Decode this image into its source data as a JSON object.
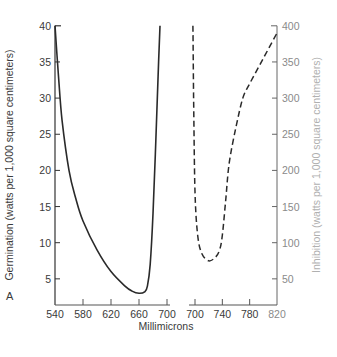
{
  "chart_data": {
    "type": "line",
    "title": "",
    "panel_label": "A",
    "xlabel": "Millimicrons",
    "ylabel_left": "Germination (watts per 1,000 square centimeters)",
    "ylabel_right": "Inhibition (watts per 1,000 square centimeters)",
    "x_axis_broken": true,
    "x_segments": [
      {
        "range": [
          540,
          700
        ],
        "ticks": [
          540,
          580,
          620,
          660,
          700
        ]
      },
      {
        "range": [
          700,
          820
        ],
        "ticks": [
          700,
          740,
          780,
          820
        ]
      }
    ],
    "ylim_left": [
      0,
      40
    ],
    "yticks_left": [
      5,
      10,
      15,
      20,
      25,
      30,
      35,
      40
    ],
    "ylim_right": [
      0,
      400
    ],
    "yticks_right": [
      50,
      100,
      150,
      200,
      250,
      300,
      350,
      400
    ],
    "grid": false,
    "legend": "none",
    "series": [
      {
        "name": "Germination",
        "axis": "left",
        "style": "solid",
        "x": [
          540,
          545,
          550,
          560,
          570,
          580,
          600,
          620,
          640,
          650,
          660,
          668,
          672,
          676,
          680,
          684,
          688,
          690
        ],
        "values": [
          40,
          33,
          27,
          20,
          16,
          13,
          9,
          6,
          4,
          3.3,
          3,
          3.2,
          4,
          7,
          14,
          24,
          35,
          40
        ]
      },
      {
        "name": "Inhibition",
        "axis": "right",
        "style": "dashed",
        "x": [
          697,
          698,
          700,
          704,
          710,
          720,
          730,
          736,
          740,
          745,
          750,
          760,
          770,
          780,
          800,
          820
        ],
        "values": [
          400,
          300,
          170,
          110,
          85,
          75,
          80,
          90,
          110,
          160,
          210,
          260,
          300,
          320,
          355,
          390
        ]
      }
    ]
  }
}
